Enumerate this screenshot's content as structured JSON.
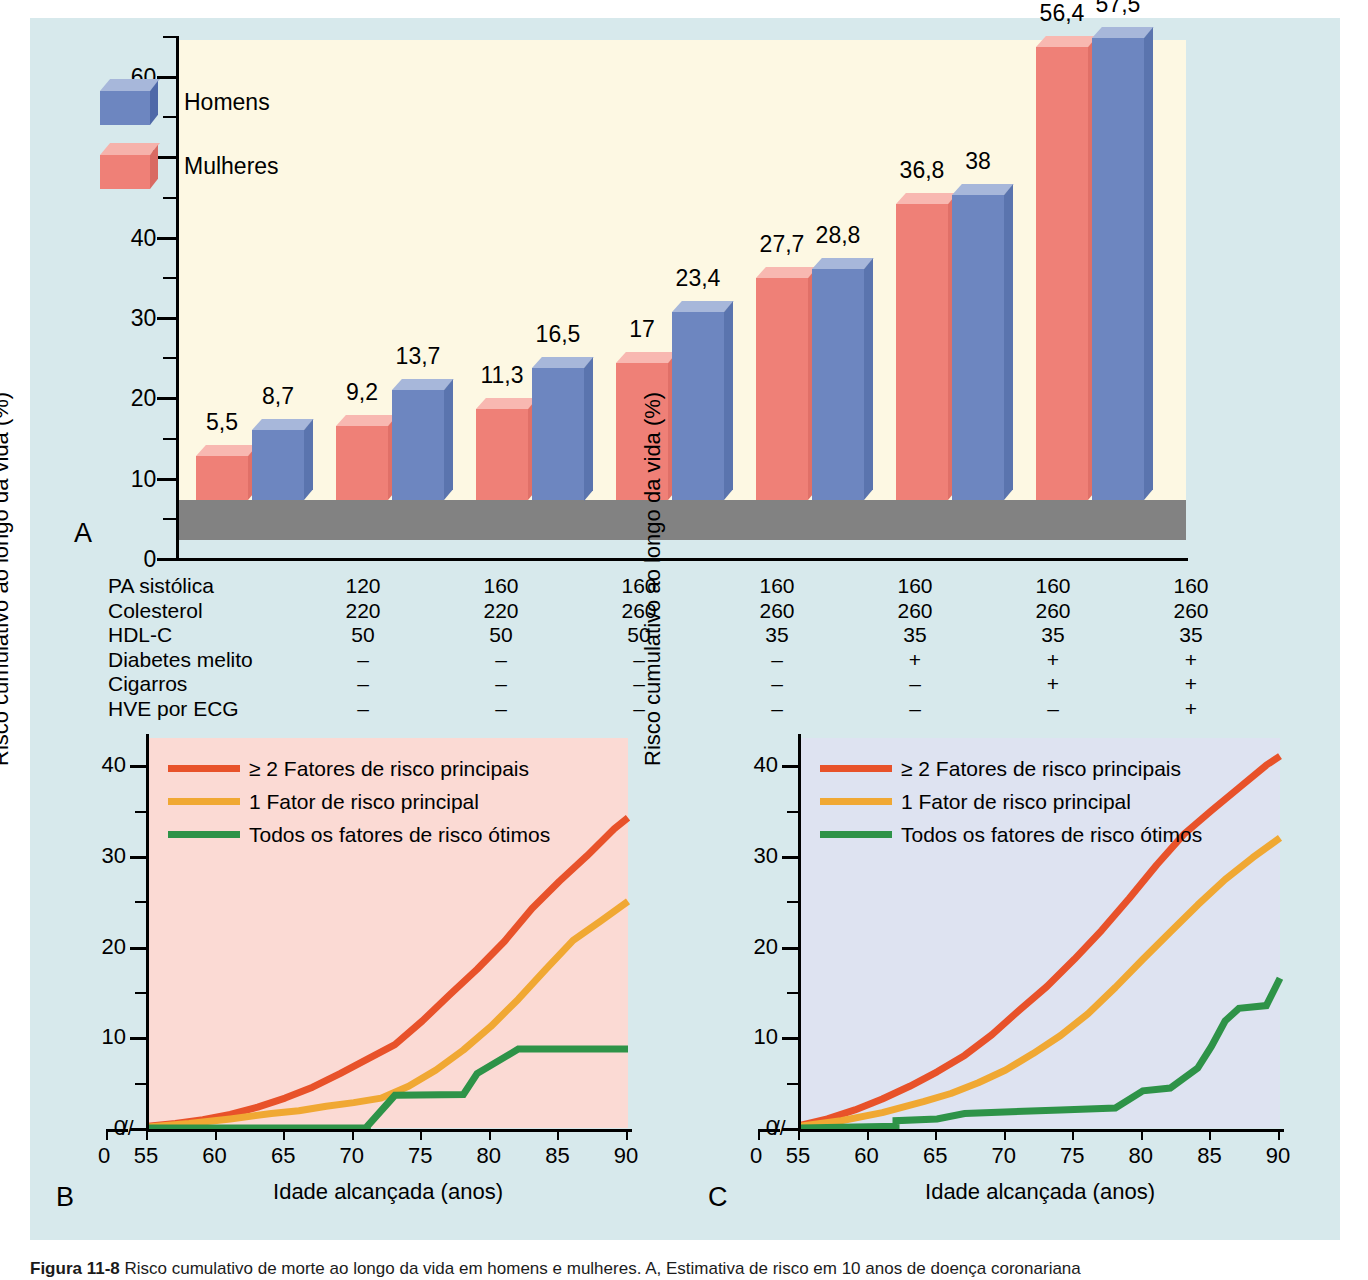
{
  "figure": {
    "caption_bold": "Figura 11-8",
    "caption_text": "Risco cumulativo de morte ao longo da vida em homens e mulheres. A, Estimativa de risco em 10 anos de doença coronariana"
  },
  "panelA": {
    "letter": "A",
    "y_title": "Estimada em 10 anos (%)",
    "legend": [
      {
        "label": "Homens",
        "color": "#6d86c0",
        "top": "#a7b7da",
        "side": "#4f69a8",
        "name": "men"
      },
      {
        "label": "Mulheres",
        "color": "#ef8077",
        "top": "#f6b2ab",
        "side": "#d96a63",
        "name": "women"
      }
    ],
    "y_ticks": [
      0,
      10,
      20,
      30,
      40,
      50,
      60
    ],
    "colors": {
      "plot_bg": "#fdf8e3",
      "floor": "#828282",
      "page_bg": "#d7e9ec"
    },
    "risk_table": {
      "rows": [
        {
          "label": "PA sistólica",
          "values": [
            "120",
            "160",
            "160",
            "160",
            "160",
            "160",
            "160"
          ]
        },
        {
          "label": "Colesterol",
          "values": [
            "220",
            "220",
            "260",
            "260",
            "260",
            "260",
            "260"
          ]
        },
        {
          "label": "HDL-C",
          "values": [
            "50",
            "50",
            "50",
            "35",
            "35",
            "35",
            "35"
          ]
        },
        {
          "label": "Diabetes melito",
          "values": [
            "–",
            "–",
            "–",
            "–",
            "+",
            "+",
            "+"
          ]
        },
        {
          "label": "Cigarros",
          "values": [
            "–",
            "–",
            "–",
            "–",
            "–",
            "+",
            "+"
          ]
        },
        {
          "label": "HVE por ECG",
          "values": [
            "–",
            "–",
            "–",
            "–",
            "–",
            "–",
            "+"
          ]
        }
      ]
    }
  },
  "panelB": {
    "letter": "B",
    "bg": "#fbdad4"
  },
  "panelC": {
    "letter": "C",
    "bg": "#dee3f1"
  },
  "chart_data": [
    {
      "type": "bar",
      "id": "panel-a-10-year-risk",
      "title": "",
      "xlabel": "",
      "ylabel": "Estimada em 10 anos (%)",
      "ylim": [
        0,
        65
      ],
      "yticks": [
        0,
        10,
        20,
        30,
        40,
        50,
        60
      ],
      "grid": false,
      "legend_position": "top-left",
      "categories": [
        "1",
        "2",
        "3",
        "4",
        "5",
        "6",
        "7"
      ],
      "series": [
        {
          "name": "Mulheres",
          "color": "#ef8077",
          "values": [
            5.5,
            9.2,
            11.3,
            17,
            27.7,
            36.8,
            56.4
          ],
          "labels": [
            "5,5",
            "9,2",
            "11,3",
            "17",
            "27,7",
            "36,8",
            "56,4"
          ]
        },
        {
          "name": "Homens",
          "color": "#6d86c0",
          "values": [
            8.7,
            13.7,
            16.5,
            23.4,
            28.8,
            38,
            57.5
          ],
          "labels": [
            "8,7",
            "13,7",
            "16,5",
            "23,4",
            "28,8",
            "38",
            "57,5"
          ]
        }
      ]
    },
    {
      "type": "line",
      "id": "panel-b-women-lifetime-risk",
      "title": "",
      "xlabel": "Idade alcançada (anos)",
      "ylabel": "Risco cumulativo ao longo da vida (%)",
      "xlim": [
        55,
        90
      ],
      "ylim": [
        0,
        43
      ],
      "xticks": [
        0,
        55,
        60,
        65,
        70,
        75,
        80,
        85,
        90
      ],
      "yticks": [
        0,
        10,
        20,
        30,
        40
      ],
      "axis_break": true,
      "grid": false,
      "legend_position": "top-left",
      "series": [
        {
          "name": "≥ 2 Fatores de risco principais",
          "color": "#e8522a",
          "x": [
            55,
            57,
            59,
            61,
            63,
            65,
            67,
            69,
            71,
            73,
            75,
            77,
            79,
            81,
            83,
            85,
            87,
            89,
            90
          ],
          "y": [
            0.2,
            0.5,
            0.9,
            1.5,
            2.3,
            3.3,
            4.5,
            6.0,
            7.6,
            9.2,
            11.8,
            14.7,
            17.5,
            20.6,
            24.2,
            27.2,
            30.0,
            33.0,
            34.2
          ]
        },
        {
          "name": "1 Fator de risco principal",
          "color": "#f0a833",
          "x": [
            55,
            58,
            61,
            64,
            66,
            68,
            70,
            72,
            74,
            76,
            78,
            80,
            82,
            84,
            86,
            88,
            90
          ],
          "y": [
            0.1,
            0.5,
            1.0,
            1.6,
            1.9,
            2.4,
            2.8,
            3.3,
            4.6,
            6.4,
            8.6,
            11.2,
            14.2,
            17.5,
            20.7,
            22.8,
            25.0
          ]
        },
        {
          "name": "Todos os fatores de risco ótimos",
          "color": "#2e9348",
          "step": true,
          "x": [
            55,
            71,
            71,
            73,
            73,
            78,
            78,
            79,
            79,
            82,
            82,
            90
          ],
          "y": [
            0,
            0,
            0.2,
            3.6,
            3.6,
            3.7,
            3.7,
            6.0,
            6.0,
            8.7,
            8.7,
            8.7
          ]
        }
      ]
    },
    {
      "type": "line",
      "id": "panel-c-men-lifetime-risk",
      "title": "",
      "xlabel": "Idade alcançada (anos)",
      "ylabel": "Risco cumulativo ao longo da vida (%)",
      "xlim": [
        55,
        90
      ],
      "ylim": [
        0,
        43
      ],
      "xticks": [
        0,
        55,
        60,
        65,
        70,
        75,
        80,
        85,
        90
      ],
      "yticks": [
        0,
        10,
        20,
        30,
        40
      ],
      "axis_break": true,
      "grid": false,
      "legend_position": "top-left",
      "series": [
        {
          "name": "≥ 2 Fatores de risco principais",
          "color": "#e8522a",
          "x": [
            55,
            57,
            59,
            61,
            63,
            65,
            67,
            69,
            71,
            73,
            75,
            77,
            79,
            81,
            83,
            85,
            87,
            89,
            90
          ],
          "y": [
            0.3,
            1.0,
            2.0,
            3.2,
            4.6,
            6.2,
            8.0,
            10.3,
            13.0,
            15.6,
            18.6,
            21.8,
            25.3,
            29.0,
            32.4,
            35.0,
            37.5,
            40.0,
            41.0
          ]
        },
        {
          "name": "1 Fator de risco principal",
          "color": "#f0a833",
          "x": [
            55,
            58,
            61,
            64,
            66,
            68,
            70,
            72,
            74,
            76,
            78,
            80,
            82,
            84,
            86,
            88,
            90
          ],
          "y": [
            0.2,
            0.8,
            1.7,
            2.9,
            3.8,
            5.0,
            6.4,
            8.2,
            10.2,
            12.6,
            15.5,
            18.6,
            21.6,
            24.6,
            27.4,
            29.8,
            32.0
          ]
        },
        {
          "name": "Todos os fatores de risco ótimos",
          "color": "#2e9348",
          "step": true,
          "x": [
            55,
            62,
            62,
            65,
            65,
            67,
            67,
            74,
            74,
            78,
            78,
            80,
            80,
            82,
            82,
            84,
            84,
            85,
            85,
            86,
            86,
            87,
            87,
            89,
            89,
            90
          ],
          "y": [
            0,
            0.2,
            0.8,
            1.0,
            1.0,
            1.6,
            1.6,
            2.0,
            2.0,
            2.2,
            2.2,
            4.1,
            4.1,
            4.4,
            4.4,
            6.6,
            6.6,
            9.0,
            9.0,
            11.8,
            11.8,
            13.2,
            13.2,
            13.5,
            13.5,
            16.5
          ]
        }
      ]
    }
  ]
}
